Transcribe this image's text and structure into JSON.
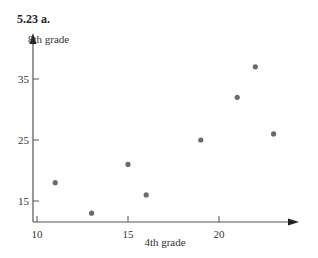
{
  "figure": {
    "title": "5.23  a."
  },
  "chart_data": {
    "type": "scatter",
    "title": "5.23 a.",
    "xlabel": "4th grade",
    "ylabel": "8th grade",
    "xlim": [
      10,
      24
    ],
    "ylim": [
      13,
      38
    ],
    "xticks": [
      10,
      15,
      20
    ],
    "yticks": [
      15,
      25,
      35
    ],
    "grid": false,
    "points": [
      {
        "x": 11,
        "y": 18
      },
      {
        "x": 13,
        "y": 13
      },
      {
        "x": 15,
        "y": 21
      },
      {
        "x": 16,
        "y": 16
      },
      {
        "x": 19,
        "y": 25
      },
      {
        "x": 21,
        "y": 32
      },
      {
        "x": 22,
        "y": 37
      },
      {
        "x": 23,
        "y": 26
      }
    ],
    "marker_color": "#6b6b6b",
    "axis_color": "#555555"
  }
}
